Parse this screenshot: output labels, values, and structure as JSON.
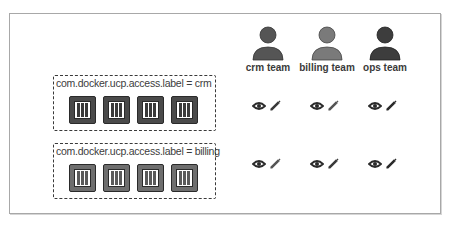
{
  "diagram": {
    "groups": [
      {
        "label": "com.docker.ucp.access.label = crm",
        "container_count": 4,
        "container_fill": "#4a4a4a",
        "container_bar": "#3a3a3a"
      },
      {
        "label": "com.docker.ucp.access.label = billing",
        "container_count": 4,
        "container_fill": "#6e6e6e",
        "container_bar": "#5a5a5a"
      }
    ],
    "teams": [
      {
        "name": "crm team",
        "color": "#555555"
      },
      {
        "name": "billing team",
        "color": "#7a7a7a"
      },
      {
        "name": "ops team",
        "color": "#3d3d3d"
      }
    ],
    "permissions": [
      [
        {
          "icons": [
            "eye-icon",
            "pencil-icon"
          ]
        },
        {
          "icons": [
            "eye-icon",
            "pencil-icon"
          ]
        },
        {
          "icons": [
            "eye-icon",
            "pencil-icon"
          ]
        }
      ],
      [
        {
          "icons": [
            "eye-icon",
            "pencil-icon"
          ]
        },
        {
          "icons": [
            "eye-icon",
            "pencil-icon"
          ]
        },
        {
          "icons": [
            "eye-icon",
            "pencil-icon"
          ]
        }
      ]
    ],
    "colors": {
      "frame": "#a8a8a8",
      "icon_dark": "#2b2b2b",
      "pencil": "#3a3a3a"
    }
  }
}
